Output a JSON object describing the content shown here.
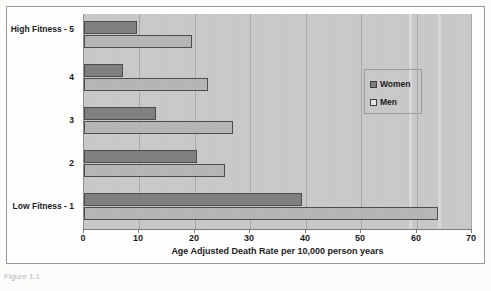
{
  "chart_data": {
    "type": "bar",
    "orientation": "horizontal",
    "title": "",
    "xlabel": "Age Adjusted Death Rate per 10,000 person years",
    "ylabel": "",
    "xlim": [
      0,
      70
    ],
    "xticks": [
      0,
      10,
      20,
      30,
      40,
      50,
      60,
      70
    ],
    "grid": "vertical",
    "legend_position": "inside-right",
    "categories": [
      "High Fitness - 5",
      "4",
      "3",
      "2",
      "Low Fitness - 1"
    ],
    "series": [
      {
        "name": "Women",
        "color": "#808080",
        "values": [
          9.5,
          7,
          13,
          20.5,
          39.5
        ]
      },
      {
        "name": "Men",
        "color": "#b6b6b6",
        "values": [
          19.5,
          22.5,
          27,
          25.5,
          64
        ]
      }
    ]
  },
  "axis": {
    "tick_labels": [
      "0",
      "10",
      "20",
      "30",
      "40",
      "50",
      "60",
      "70"
    ],
    "title": "Age Adjusted Death Rate per 10,000 person years"
  },
  "y_axis": {
    "labels": [
      "High Fitness - 5",
      "4",
      "3",
      "2",
      "Low Fitness - 1"
    ]
  },
  "legend": {
    "items": [
      {
        "label": "Women",
        "swatch": "women-swatch-icon"
      },
      {
        "label": "Men",
        "swatch": "men-swatch-icon"
      }
    ]
  },
  "caption": {
    "sliver_text": "Figure 1.1"
  },
  "colors": {
    "plot_background": "#c9c9c9",
    "gridline": "#a9a9a9",
    "women_bar": "#808080",
    "men_bar": "#b6b6b6",
    "bar_outline": "#4d4d4d",
    "frame": "#9a9a9a",
    "text": "#1b1b1b"
  }
}
